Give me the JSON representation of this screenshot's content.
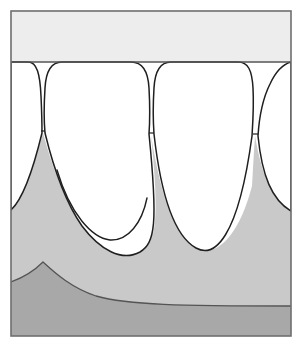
{
  "figure": {
    "kind": "anatomical-line-drawing",
    "canvas": {
      "width": 302,
      "height": 351
    },
    "frame": {
      "x": 11,
      "y": 11,
      "width": 280,
      "height": 325,
      "stroke": "#6e6e6e",
      "stroke_width": 1.6,
      "fill": "#ffffff"
    }
  },
  "palette": {
    "background": "#ffffff",
    "frame_stroke": "#6e6e6e",
    "upper_band": "#ededed",
    "tooth_enamel": "#ffffff",
    "gingiva": "#c9c9c9",
    "alveolar_bone": "#a8a8a8",
    "outline": "#1f1f1f",
    "soft_outline": "#545454"
  },
  "regions": [
    {
      "id": "upper-band",
      "label": "Upper oral mucosa band",
      "fill": "#ededed",
      "path": "M 11 11 L 291 11 L 291 62 L 11 62 Z"
    },
    {
      "id": "gingiva-mass",
      "label": "Gingiva / attached gum tissue",
      "fill": "#c9c9c9",
      "path": "M 11 336 L 11 210 C 22 200 33 170 43 133 C 53 170 66 203 82 226 C 100 250 122 262 140 252 C 156 243 160 224 151 135 C 162 205 178 238 196 248 C 214 258 238 240 252 186 C 253 168 254 150 255 136 C 262 176 272 200 291 211 L 291 336 Z"
    },
    {
      "id": "alveolar-bone",
      "label": "Alveolar bone with horizontal bone loss",
      "fill": "#a8a8a8",
      "path": "M 11 336 L 11 282 C 22 278 33 272 43 262 C 56 274 72 288 96 296 C 128 305 180 306 291 306 L 291 336 Z"
    }
  ],
  "teeth": [
    {
      "id": "tooth-left-partial",
      "label": "Left partial tooth (cut by frame)",
      "fill": "#ffffff",
      "crown_top_y": 62,
      "root_apex_y": 205,
      "path": "M 11 62 L 28 62 C 37 62 40 74 41 96 C 42 118 42 128 42 133 C 33 170 22 200 11 210 Z"
    },
    {
      "id": "tooth-1",
      "label": "Central tooth 1",
      "fill": "#ffffff",
      "crown_top_y": 62,
      "root_apex_y": 252,
      "path": "M 45 133 C 44 122 44 104 45 88 C 46 70 52 62 62 62 L 131 62 C 142 62 148 70 149 88 C 150 106 150 120 149 134 C 158 224 155 243 140 252 C 122 262 100 250 82 226 C 66 203 54 170 45 133 Z"
    },
    {
      "id": "tooth-2",
      "label": "Central tooth 2",
      "fill": "#ffffff",
      "crown_top_y": 62,
      "root_apex_y": 248,
      "path": "M 154 134 C 153 120 153 104 154 88 C 155 70 161 62 171 62 L 238 62 C 248 62 252 70 253 88 C 254 106 253 120 252 136 C 238 240 214 258 196 248 C 178 238 162 205 154 134 Z"
    },
    {
      "id": "tooth-right-partial",
      "label": "Right partial tooth (cut by frame)",
      "fill": "#ffffff",
      "crown_top_y": 62,
      "root_apex_y": 211,
      "path": "M 258 136 C 259 120 262 100 270 84 C 276 71 284 64 291 62 L 291 211 C 272 200 262 176 258 136 Z"
    }
  ],
  "detail_lines": [
    {
      "id": "papilla-notch-1",
      "label": "Interdental papilla notch 1",
      "path": "M 41 131 L 45 131"
    },
    {
      "id": "papilla-notch-2",
      "label": "Interdental papilla notch 2",
      "path": "M 149 133 L 154 133"
    },
    {
      "id": "papilla-notch-3",
      "label": "Interdental papilla notch 3",
      "path": "M 253 134 L 258 134"
    },
    {
      "id": "periodontal-ligament-tooth-1",
      "label": "Inner periodontal ligament line of tooth 1",
      "path": "M 57 170 C 70 214 92 238 110 240 C 128 241 142 223 147 198"
    },
    {
      "id": "bone-crest-line",
      "label": "Crest of alveolar bone",
      "path": "M 11 282 C 22 278 33 272 43 262 C 56 274 72 288 96 296 C 128 305 180 306 291 306"
    },
    {
      "id": "gingival-margin-line",
      "label": "Gingival margin along crown cervix",
      "path": "M 11 62 L 291 62"
    }
  ],
  "annotations": {
    "visible_text": [],
    "note": "No text labels are rendered in this figure."
  }
}
